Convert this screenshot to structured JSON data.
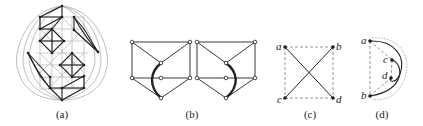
{
  "figure": {
    "panels": [
      {
        "id": "a",
        "caption": "(a)"
      },
      {
        "id": "b",
        "caption": "(b)"
      },
      {
        "id": "c",
        "caption": "(c)",
        "vertices": [
          "a",
          "b",
          "c",
          "d"
        ]
      },
      {
        "id": "d",
        "caption": "(d)",
        "vertices": [
          "a",
          "c",
          "d",
          "b"
        ]
      }
    ]
  },
  "colors": {
    "edge": "#222222",
    "light_edge": "#9a9a9a",
    "dashed": "#777777",
    "background": "#ffffff"
  }
}
